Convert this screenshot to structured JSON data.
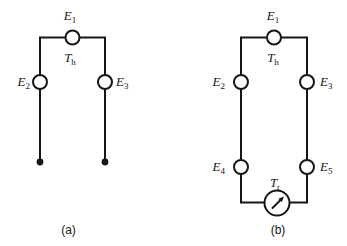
{
  "figure": {
    "type": "diagram",
    "colors": {
      "line": "#161616",
      "background": "#ffffff"
    },
    "panel_a": {
      "caption": "(a)",
      "labels": {
        "e1": {
          "main": "E",
          "sub": "1"
        },
        "th": {
          "main": "T",
          "sub": "h"
        },
        "e2": {
          "main": "E",
          "sub": "2"
        },
        "e3": {
          "main": "E",
          "sub": "3"
        }
      }
    },
    "panel_b": {
      "caption": "(b)",
      "labels": {
        "e1": {
          "main": "E",
          "sub": "1"
        },
        "th": {
          "main": "T",
          "sub": "h"
        },
        "e2": {
          "main": "E",
          "sub": "2"
        },
        "e3": {
          "main": "E",
          "sub": "3"
        },
        "e4": {
          "main": "E",
          "sub": "4"
        },
        "e5": {
          "main": "E",
          "sub": "5"
        },
        "tr": {
          "main": "T",
          "sub": "r"
        }
      }
    }
  }
}
